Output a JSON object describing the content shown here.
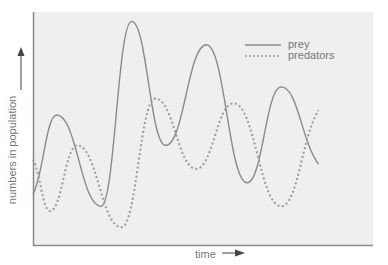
{
  "chart_data": {
    "type": "line",
    "title": "",
    "xlabel": "time",
    "ylabel": "numbers in population",
    "grid": false,
    "legend_position": "top-right",
    "axis_ticks": "none",
    "note": "Qualitative predator-prey oscillation; values are relative heights (0 = bottom axis, 100 = top of plot), x is relative time 0-100",
    "series": [
      {
        "name": "prey",
        "style": "solid",
        "color": "#8a8a8a",
        "points": [
          [
            0,
            22
          ],
          [
            7,
            56
          ],
          [
            20,
            17
          ],
          [
            29,
            96
          ],
          [
            39,
            43
          ],
          [
            51,
            86
          ],
          [
            63,
            27
          ],
          [
            73,
            68
          ],
          [
            84,
            35
          ]
        ]
      },
      {
        "name": "predators",
        "style": "dotted",
        "color": "#9a9a9a",
        "points": [
          [
            0,
            37
          ],
          [
            5,
            15
          ],
          [
            13,
            43
          ],
          [
            26,
            8
          ],
          [
            36,
            63
          ],
          [
            48,
            33
          ],
          [
            59,
            61
          ],
          [
            73,
            17
          ],
          [
            84,
            58
          ]
        ]
      }
    ],
    "ylim": [
      0,
      100
    ],
    "xlim": [
      0,
      100
    ]
  },
  "legend": {
    "prey": "prey",
    "predators": "predators"
  },
  "axes": {
    "x_label": "time",
    "y_label": "numbers in population"
  },
  "colors": {
    "plot_bg": "#efefef",
    "axis": "#888888",
    "prey": "#8a8a8a",
    "predators": "#9a9a9a",
    "arrow": "#444444"
  }
}
